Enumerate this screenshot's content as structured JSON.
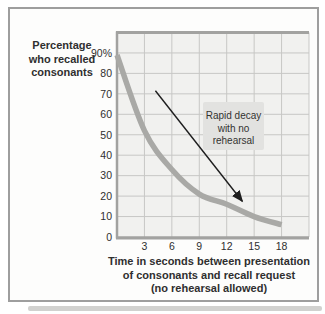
{
  "figure": {
    "y_axis_title_lines": [
      "Percentage",
      "who recalled",
      "consonants"
    ],
    "x_axis_title_lines": [
      "Time in seconds between presentation",
      "of consonants and recall request",
      "(no rehearsal allowed)"
    ],
    "annotation_lines": [
      "Rapid decay",
      "with no",
      "rehearsal"
    ]
  },
  "chart_data": {
    "type": "line",
    "title": "",
    "xlabel": "Time in seconds between presentation of consonants and recall request (no rehearsal allowed)",
    "ylabel": "Percentage who recalled consonants",
    "x": [
      0,
      3,
      6,
      9,
      12,
      15,
      18
    ],
    "series": [
      {
        "name": "Percentage who recalled consonants",
        "values": [
          89,
          52,
          33,
          21,
          16,
          10,
          6
        ]
      }
    ],
    "x_ticks": [
      3,
      6,
      9,
      12,
      15,
      18
    ],
    "y_tick_values": [
      90,
      80,
      70,
      60,
      50,
      40,
      30,
      20,
      10,
      0
    ],
    "y_tick_labels": [
      "90%",
      "80",
      "70",
      "60",
      "50",
      "40",
      "30",
      "20",
      "10",
      "0"
    ],
    "xlim": [
      0,
      21
    ],
    "ylim": [
      0,
      100
    ],
    "grid": true,
    "legend": "none",
    "annotation": {
      "text": "Rapid decay with no rehearsal",
      "arrow_from": [
        4.2,
        71.5
      ],
      "arrow_to": [
        13.7,
        17.5
      ]
    },
    "colors": {
      "curve": "#a9a9a6",
      "plot_bg": "#f1f1ef",
      "gridline": "#c7c7c5",
      "axis": "#a2a2a0",
      "text": "#2f2f2f",
      "annotation_bg": "#e2e2e0",
      "arrow": "#1e1e1e",
      "card_border": "#9e9e9e",
      "card_bg": "#fdfdfc",
      "shadow": "#c9c9c7"
    }
  }
}
